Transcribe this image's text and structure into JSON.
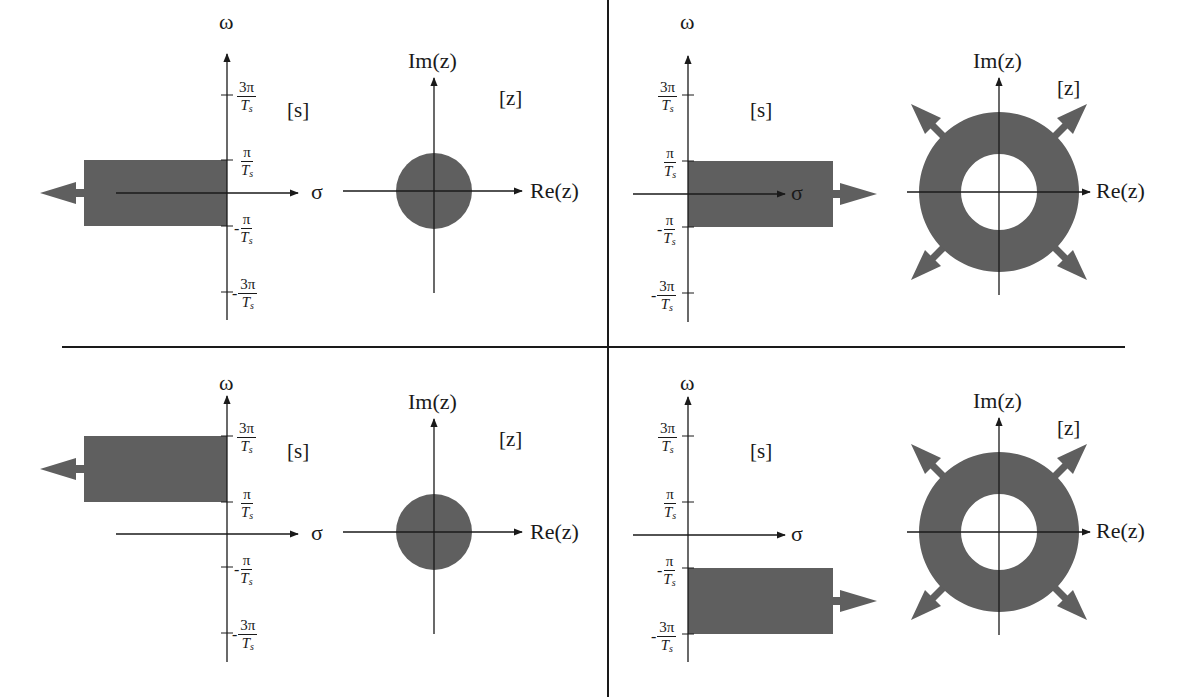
{
  "figure": {
    "colors": {
      "region_fill": "#5f5f5f",
      "axis": "#1a1a1a",
      "divider": "#1a1a1a",
      "background": "#ffffff"
    },
    "panels": [
      {
        "id": "top-left",
        "s_plane": {
          "tag": "[s]",
          "vertical_axis": "ω",
          "horizontal_axis": "σ",
          "ticks": [
            {
              "sign": "",
              "num": "3π",
              "den": "T",
              "sub": "s"
            },
            {
              "sign": "",
              "num": "π",
              "den": "T",
              "sub": "s"
            },
            {
              "sign": "-",
              "num": "π",
              "den": "T",
              "sub": "s"
            },
            {
              "sign": "-",
              "num": "3π",
              "den": "T",
              "sub": "s"
            }
          ],
          "region": "Left half-plane strip between -π/Ts and π/Ts, extending to -∞",
          "arrow_direction": "left"
        },
        "z_plane": {
          "tag": "[z]",
          "vertical_axis": "Im(z)",
          "horizontal_axis": "Re(z)",
          "region": "Filled disc (interior of unit circle)",
          "arrows": []
        }
      },
      {
        "id": "top-right",
        "s_plane": {
          "tag": "[s]",
          "vertical_axis": "ω",
          "horizontal_axis": "σ",
          "ticks": [
            {
              "sign": "",
              "num": "3π",
              "den": "T",
              "sub": "s"
            },
            {
              "sign": "",
              "num": "π",
              "den": "T",
              "sub": "s"
            },
            {
              "sign": "-",
              "num": "π",
              "den": "T",
              "sub": "s"
            },
            {
              "sign": "-",
              "num": "3π",
              "den": "T",
              "sub": "s"
            }
          ],
          "region": "Right half-plane strip between -π/Ts and π/Ts, extending to +∞",
          "arrow_direction": "right"
        },
        "z_plane": {
          "tag": "[z]",
          "vertical_axis": "Im(z)",
          "horizontal_axis": "Re(z)",
          "region": "Annulus outside unit circle, extending outward",
          "arrows": [
            "up-left",
            "up-right",
            "down-left",
            "down-right"
          ]
        }
      },
      {
        "id": "bottom-left",
        "s_plane": {
          "tag": "[s]",
          "vertical_axis": "ω",
          "horizontal_axis": "σ",
          "ticks": [
            {
              "sign": "",
              "num": "3π",
              "den": "T",
              "sub": "s"
            },
            {
              "sign": "",
              "num": "π",
              "den": "T",
              "sub": "s"
            },
            {
              "sign": "-",
              "num": "π",
              "den": "T",
              "sub": "s"
            },
            {
              "sign": "-",
              "num": "3π",
              "den": "T",
              "sub": "s"
            }
          ],
          "region": "Left half-plane strip between π/Ts and 3π/Ts, extending to -∞",
          "arrow_direction": "left"
        },
        "z_plane": {
          "tag": "[z]",
          "vertical_axis": "Im(z)",
          "horizontal_axis": "Re(z)",
          "region": "Filled disc (interior of unit circle)",
          "arrows": []
        }
      },
      {
        "id": "bottom-right",
        "s_plane": {
          "tag": "[s]",
          "vertical_axis": "ω",
          "horizontal_axis": "σ",
          "ticks": [
            {
              "sign": "",
              "num": "3π",
              "den": "T",
              "sub": "s"
            },
            {
              "sign": "",
              "num": "π",
              "den": "T",
              "sub": "s"
            },
            {
              "sign": "-",
              "num": "π",
              "den": "T",
              "sub": "s"
            },
            {
              "sign": "-",
              "num": "3π",
              "den": "T",
              "sub": "s"
            }
          ],
          "region": "Right half-plane strip between -3π/Ts and -π/Ts, extending to +∞",
          "arrow_direction": "right"
        },
        "z_plane": {
          "tag": "[z]",
          "vertical_axis": "Im(z)",
          "horizontal_axis": "Re(z)",
          "region": "Annulus outside unit circle, extending outward",
          "arrows": [
            "up-left",
            "up-right",
            "down-left",
            "down-right"
          ]
        }
      }
    ]
  }
}
